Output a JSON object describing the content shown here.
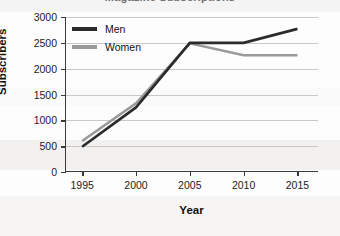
{
  "chart_data": {
    "type": "line",
    "title": "Magazine Subscriptions",
    "xlabel": "Year",
    "ylabel": "Subscribers",
    "categories": [
      1995,
      2000,
      2005,
      2010,
      2015
    ],
    "x_tick_labels": [
      "1995",
      "2000",
      "2005",
      "2010",
      "2015"
    ],
    "y_tick_labels": [
      "0",
      "500",
      "1000",
      "1500",
      "2000",
      "2500",
      "3000"
    ],
    "y_ticks": [
      0,
      500,
      1000,
      1500,
      2000,
      2500,
      3000
    ],
    "ylim": [
      0,
      3000
    ],
    "xlim": [
      1993.5,
      2017
    ],
    "grid": true,
    "legend_position": "upper left",
    "series": [
      {
        "name": "Men",
        "color": "#2b2b2b",
        "values": [
          490,
          1250,
          2500,
          2500,
          2770
        ]
      },
      {
        "name": "Women",
        "color": "#9a9a9a",
        "values": [
          600,
          1330,
          2490,
          2260,
          2260
        ]
      }
    ]
  },
  "axes": {
    "y_title": "Subscribers",
    "x_title": "Year"
  }
}
